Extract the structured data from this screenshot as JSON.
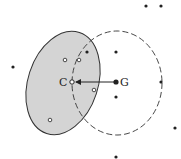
{
  "diagram": {
    "labels": {
      "c": "C",
      "g": "G"
    },
    "colors": {
      "fill": "#d4d4d4",
      "stroke": "#333333",
      "dot": "#222222",
      "background": "#ffffff"
    },
    "shaded_ellipse": {
      "cx": 63,
      "cy": 83,
      "rx": 35,
      "ry": 53,
      "rotate": 18
    },
    "dashed_circle": {
      "cx": 117,
      "cy": 83,
      "rx": 45,
      "ry": 52
    },
    "point_c": {
      "x": 72,
      "y": 82
    },
    "point_g": {
      "x": 116,
      "y": 82
    },
    "filled_dots": [
      {
        "x": 13,
        "y": 67
      },
      {
        "x": 146,
        "y": 6
      },
      {
        "x": 161,
        "y": 6
      },
      {
        "x": 87,
        "y": 52
      },
      {
        "x": 116,
        "y": 52
      },
      {
        "x": 161,
        "y": 82
      },
      {
        "x": 116,
        "y": 97
      },
      {
        "x": 175,
        "y": 128
      },
      {
        "x": 116,
        "y": 157
      }
    ],
    "hollow_dots": [
      {
        "x": 65,
        "y": 60
      },
      {
        "x": 79,
        "y": 60
      },
      {
        "x": 94,
        "y": 90
      },
      {
        "x": 50,
        "y": 120
      }
    ]
  }
}
